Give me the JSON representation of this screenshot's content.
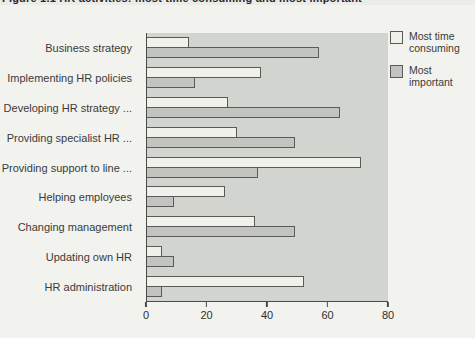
{
  "title": {
    "text": "Figure 1.1 HR activities: most time consuming and most important"
  },
  "colors": {
    "page_bg": "#f2f2ee",
    "plot_bg": "#d2d5cf",
    "bar_outline": "#5a5a58",
    "axis": "#4a4a48"
  },
  "chart_data": {
    "type": "bar",
    "orientation": "horizontal",
    "categories": [
      "Business strategy",
      "Implementing HR policies",
      "Developing HR strategy ...",
      "Providing specialist HR ...",
      "Providing support to line ...",
      "Helping employees",
      "Changing management",
      "Updating own HR",
      "HR administration"
    ],
    "series": [
      {
        "name": "Most time consuming",
        "color": "#f0f1ea",
        "values": [
          14,
          38,
          27,
          30,
          71,
          26,
          36,
          5,
          52
        ]
      },
      {
        "name": "Most important",
        "color": "#c2c5bf",
        "values": [
          57,
          16,
          64,
          49,
          37,
          9,
          49,
          9,
          5
        ]
      }
    ],
    "xlabel": "",
    "ylabel": "",
    "xlim": [
      0,
      80
    ],
    "xticks": [
      0,
      20,
      40,
      60,
      80
    ],
    "grid": false,
    "legend_position": "top-right",
    "plot_bg": "#d2d5cf"
  }
}
